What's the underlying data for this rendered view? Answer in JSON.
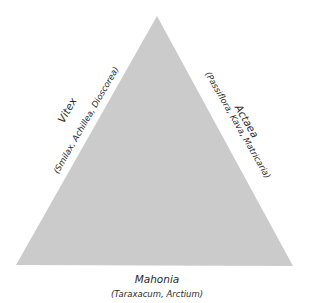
{
  "diagram": {
    "type": "triangle",
    "fill_color": "#cbcbcb",
    "vertices": {
      "apex": [
        157,
        16
      ],
      "bottom_left": [
        16,
        265
      ],
      "bottom_right": [
        293,
        266
      ]
    },
    "sides": {
      "left": {
        "label": "Vitex",
        "sub": "(Smilax, Achillea, Dioscorea)"
      },
      "right": {
        "label": "Actaea",
        "sub": "(Passiflora, Kava, Matricaria)"
      },
      "bottom": {
        "label": "Mahonia",
        "sub": "(Taraxacum, Arctium)"
      }
    }
  }
}
